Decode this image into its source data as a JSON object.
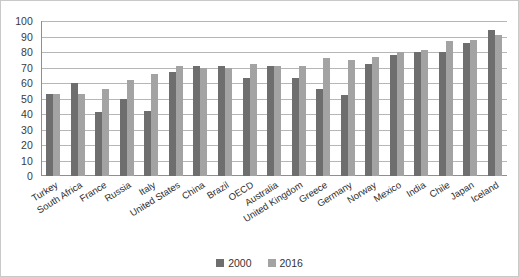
{
  "chart_data": {
    "type": "bar",
    "title": "",
    "subtitle": "",
    "xlabel": "",
    "ylabel": "",
    "ylim": [
      0,
      100
    ],
    "ytick_step": 10,
    "yticks": [
      100,
      90,
      80,
      70,
      60,
      50,
      40,
      30,
      20,
      10,
      0
    ],
    "grid": true,
    "legend_position": "bottom",
    "categories": [
      "Turkey",
      "South Africa",
      "France",
      "Russia",
      "Italy",
      "United States",
      "China",
      "Brazil",
      "OECD",
      "Australia",
      "United Kingdom",
      "Greece",
      "Germany",
      "Norway",
      "Mexico",
      "India",
      "Chile",
      "Japan",
      "Iceland"
    ],
    "series": [
      {
        "name": "2000",
        "color": "#6e6e6e",
        "values": [
          53,
          60,
          41,
          50,
          42,
          67,
          71,
          71,
          63,
          71,
          63,
          56,
          52,
          72,
          78,
          80,
          80,
          86,
          94
        ]
      },
      {
        "name": "2016",
        "color": "#a3a3a3",
        "values": [
          53,
          53,
          56,
          62,
          66,
          71,
          70,
          70,
          72,
          71,
          71,
          76,
          75,
          77,
          80,
          81,
          87,
          88,
          91
        ]
      }
    ]
  },
  "legend": {
    "items": [
      {
        "label": "2000",
        "color": "#6e6e6e"
      },
      {
        "label": "2016",
        "color": "#a3a3a3"
      }
    ]
  },
  "colors": {
    "series_2000": "#6e6e6e",
    "series_2016": "#a3a3a3",
    "gridline": "#b6b6b6",
    "axis": "#8f8f8f",
    "background": "#ffffff",
    "border": "#c9c9c9",
    "text": "#2e2e2e"
  }
}
